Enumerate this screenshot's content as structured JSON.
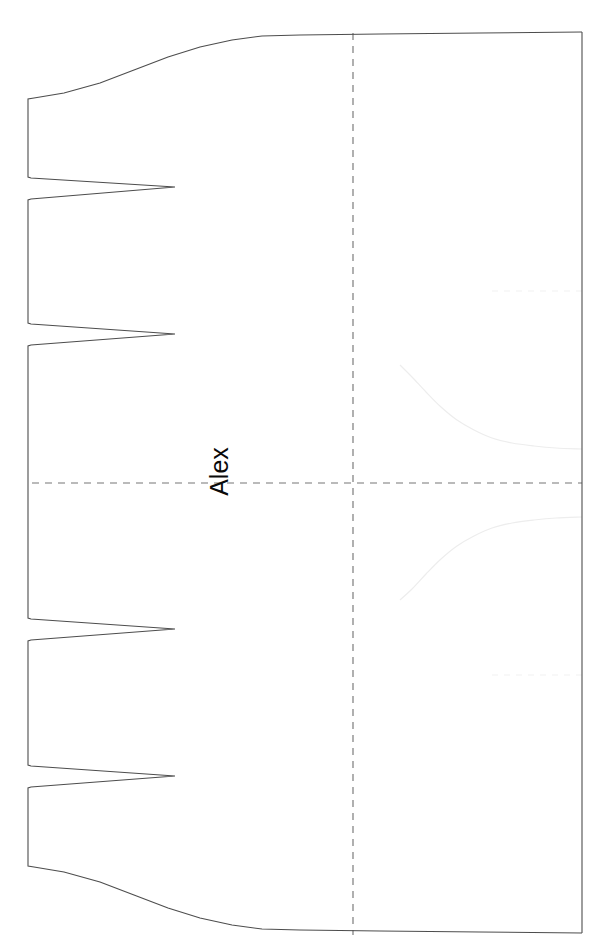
{
  "figure": {
    "label": "Alex",
    "label_rotation_deg": -90,
    "background_color": "#ffffff",
    "outline_color": "#4d4d4d",
    "crosshair_color": "#767676",
    "ghost_color": "#ededed",
    "label_color": "#0a0a0a"
  },
  "chart_data": {
    "type": "line",
    "title": "Alex",
    "subtitle": "",
    "xlabel": "",
    "ylabel": "",
    "orientation": "rotated-90",
    "grid": false,
    "legend": "none",
    "xlim": [
      28,
      582
    ],
    "ylim": [
      32,
      935
    ],
    "annotations": [
      {
        "text": "Alex",
        "x": 207,
        "y": 483,
        "rotation": -90,
        "color": "#0a0a0a"
      }
    ],
    "reference_lines": [
      {
        "name": "center-horizontal",
        "orientation": "horizontal",
        "value": 483,
        "style": "dashed",
        "color": "#767676",
        "x_from": 32,
        "x_to": 582
      },
      {
        "name": "center-vertical",
        "orientation": "vertical",
        "value": 353,
        "style": "dashed",
        "color": "#767676",
        "y_from": 33,
        "y_to": 935
      },
      {
        "name": "upper-faint-horizontal",
        "orientation": "horizontal",
        "value": 291,
        "style": "dashed",
        "color": "#f1f1f1",
        "x_from": 492,
        "x_to": 582
      },
      {
        "name": "lower-faint-horizontal",
        "orientation": "horizontal",
        "value": 675,
        "style": "dashed",
        "color": "#f1f1f1",
        "x_from": 492,
        "x_to": 582
      }
    ],
    "series": [
      {
        "name": "outline-profile",
        "color": "#4d4d4d",
        "points": [
          [
            582,
            32
          ],
          [
            480,
            33
          ],
          [
            380,
            34
          ],
          [
            300,
            35
          ],
          [
            262,
            36
          ],
          [
            232,
            40
          ],
          [
            200,
            47
          ],
          [
            168,
            57
          ],
          [
            134,
            70
          ],
          [
            100,
            83
          ],
          [
            64,
            93
          ],
          [
            34,
            98
          ],
          [
            28,
            99
          ],
          [
            28,
            177
          ],
          [
            31,
            178
          ],
          [
            175,
            187
          ],
          [
            31,
            199
          ],
          [
            28,
            200
          ],
          [
            28,
            323
          ],
          [
            31,
            324
          ],
          [
            175,
            334
          ],
          [
            31,
            345
          ],
          [
            28,
            346
          ],
          [
            28,
            618
          ],
          [
            31,
            619
          ],
          [
            175,
            629
          ],
          [
            31,
            640
          ],
          [
            28,
            641
          ],
          [
            28,
            765
          ],
          [
            31,
            766
          ],
          [
            175,
            776
          ],
          [
            31,
            787
          ],
          [
            28,
            788
          ],
          [
            28,
            866
          ],
          [
            34,
            867
          ],
          [
            64,
            872
          ],
          [
            100,
            882
          ],
          [
            134,
            895
          ],
          [
            168,
            908
          ],
          [
            200,
            918
          ],
          [
            232,
            925
          ],
          [
            262,
            929
          ],
          [
            300,
            930
          ],
          [
            380,
            931
          ],
          [
            480,
            932
          ],
          [
            582,
            933
          ]
        ]
      },
      {
        "name": "ghost-upper",
        "color": "#ededed",
        "points": [
          [
            400,
            365
          ],
          [
            412,
            377
          ],
          [
            426,
            392
          ],
          [
            441,
            407
          ],
          [
            457,
            420
          ],
          [
            474,
            430
          ],
          [
            492,
            438
          ],
          [
            512,
            443
          ],
          [
            534,
            446
          ],
          [
            556,
            448
          ],
          [
            582,
            449
          ]
        ]
      },
      {
        "name": "ghost-lower",
        "color": "#ededed",
        "points": [
          [
            400,
            600
          ],
          [
            412,
            589
          ],
          [
            426,
            574
          ],
          [
            441,
            559
          ],
          [
            457,
            546
          ],
          [
            474,
            536
          ],
          [
            492,
            528
          ],
          [
            512,
            523
          ],
          [
            534,
            520
          ],
          [
            556,
            518
          ],
          [
            582,
            517
          ]
        ]
      }
    ]
  }
}
